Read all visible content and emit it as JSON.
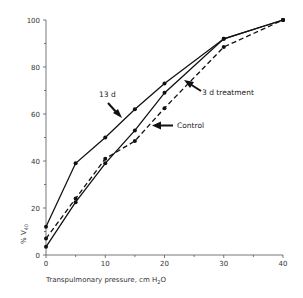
{
  "chart_data": {
    "type": "line",
    "title": "",
    "xlabel": "Transpulmonary pressure, cm H2O",
    "xlabel_parts": {
      "main": "Transpulmonary pressure, cm H",
      "sub": "2",
      "tail": "O"
    },
    "ylabel": "% V40",
    "ylabel_parts": {
      "main": "% V",
      "sub": "40"
    },
    "xlim": [
      0,
      40
    ],
    "ylim": [
      0,
      100
    ],
    "x_ticks": [
      0,
      10,
      20,
      30,
      40
    ],
    "x_minor_ticks": [
      5,
      15,
      25,
      35
    ],
    "y_ticks": [
      0,
      20,
      40,
      60,
      80,
      100
    ],
    "y_minor_ticks": [
      10,
      30,
      50,
      70,
      90
    ],
    "grid": false,
    "legend": "none (series labelled by arrow annotations)",
    "x": [
      0,
      5,
      10,
      15,
      20,
      30,
      40
    ],
    "series": [
      {
        "name": "13 d",
        "style": "solid",
        "values": [
          12,
          39,
          50,
          62,
          73,
          92,
          100
        ]
      },
      {
        "name": "3 d treatment",
        "style": "solid",
        "values": [
          3.5,
          22.5,
          39,
          53,
          69,
          92,
          100
        ]
      },
      {
        "name": "Control",
        "style": "dashed",
        "values": [
          7,
          24,
          41,
          48.5,
          62.5,
          88.5,
          100
        ]
      }
    ],
    "annotations": [
      {
        "text": "13 d",
        "points_to": "13 d"
      },
      {
        "text": "3 d treatment",
        "points_to": "3 d treatment"
      },
      {
        "text": "Control",
        "points_to": "Control"
      }
    ]
  }
}
